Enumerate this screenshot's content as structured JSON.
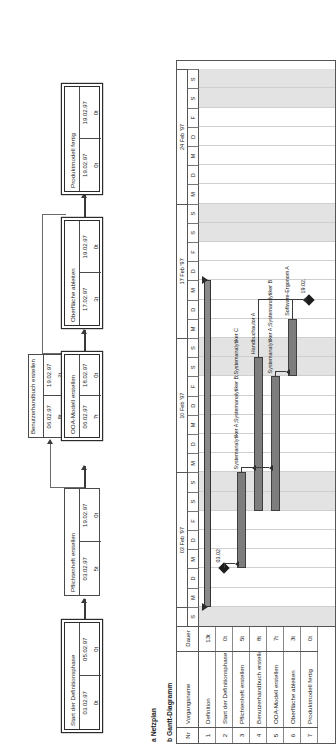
{
  "figure": {
    "caption_a": "a Netzplan",
    "caption_b": "b Gantt-Diagramm",
    "legend": "Legende: Netzplan"
  },
  "netzplan": {
    "nodes": [
      {
        "id": "start",
        "name": "Start der Definitionsphase",
        "early_start": "03.02.97",
        "late_start": "05.02.97",
        "float_left": "0t",
        "float_right": "0t",
        "critical": true
      },
      {
        "id": "pflichtenheft",
        "name": "Pflichtenheft erstellen",
        "early_start": "03.02.97",
        "late_start": "19.02.97",
        "float_left": "5t",
        "float_right": "0t",
        "critical": false
      },
      {
        "id": "benutzerhandbuch",
        "name": "Benutzerhandbuch erstellen",
        "early_start": "06.02.97",
        "late_start": "19.02.97",
        "float_left": "8t",
        "float_right": "2t",
        "critical": false
      },
      {
        "id": "ooa",
        "name": "OOA-Modell erstellen",
        "early_start": "06.02.97",
        "late_start": "18.02.97",
        "float_left": "7t",
        "float_right": "0t",
        "critical": true
      },
      {
        "id": "oberflaeche",
        "name": "Oberfläche ableiten",
        "early_start": "17.02.97",
        "late_start": "19.02.97",
        "float_left": "3t",
        "float_right": "0t",
        "critical": true
      },
      {
        "id": "produktmodell",
        "name": "Produktmodell fertig",
        "early_start": "19.02.97",
        "late_start": "19.02.97",
        "float_left": "0t",
        "float_right": "0t",
        "critical": true
      }
    ]
  },
  "gantt": {
    "columns": {
      "nr": "Nr",
      "name": "Vorgangsname",
      "duration": "Dauer"
    },
    "rows": [
      {
        "nr": "1",
        "name": "Definition",
        "duration": "13t",
        "type": "summary",
        "start_day": 0,
        "length_days": 17,
        "resources": ""
      },
      {
        "nr": "2",
        "name": "Start der Definitionsphase",
        "duration": "0t",
        "type": "milestone",
        "start_day": 2,
        "length_days": 0,
        "resources": "03.02"
      },
      {
        "nr": "3",
        "name": "Pflichtenheft erstellen",
        "duration": "5t",
        "type": "task",
        "start_day": 2,
        "length_days": 5,
        "resources": "Systemanalytiker A;Systemanalytiker B;Systemanalytiker C"
      },
      {
        "nr": "4",
        "name": "Benutzerhandbuch erstellen",
        "duration": "8t",
        "type": "task",
        "start_day": 5,
        "length_days": 8,
        "resources": "Handbuchautor A"
      },
      {
        "nr": "5",
        "name": "OOA-Modell erstellen",
        "duration": "7t",
        "type": "task",
        "start_day": 5,
        "length_days": 7,
        "resources": "Systemanalytiker A;Systemanalytiker B"
      },
      {
        "nr": "6",
        "name": "Oberfläche ableiten",
        "duration": "3t",
        "type": "task",
        "start_day": 12,
        "length_days": 3,
        "resources": "Software-Ergonom A"
      },
      {
        "nr": "7",
        "name": "Produktmodell fertig",
        "duration": "0t",
        "type": "milestone",
        "start_day": 16,
        "length_days": 0,
        "resources": "19.02."
      }
    ],
    "timeline": {
      "weeks": [
        "03 Feb '97",
        "10 Feb '97",
        "17 Feb '97",
        "24 Feb '97"
      ],
      "days": [
        "M",
        "D",
        "M",
        "D",
        "F",
        "S",
        "S"
      ],
      "lead_days": [
        "S"
      ]
    }
  },
  "chart_data": {
    "type": "bar",
    "xlabel": "Kalenderwoche Feb '97",
    "ylabel": "Vorgang",
    "categories": [
      "Definition",
      "Start der Definitionsphase",
      "Pflichtenheft erstellen",
      "Benutzerhandbuch erstellen",
      "OOA-Modell erstellen",
      "Oberfläche ableiten",
      "Produktmodell fertig"
    ],
    "values": [
      13,
      0,
      5,
      8,
      7,
      3,
      0
    ],
    "bar_starts_days": [
      0,
      2,
      2,
      5,
      5,
      12,
      16
    ],
    "series": [
      {
        "name": "Dauer (Tage)",
        "values": [
          13,
          0,
          5,
          8,
          7,
          3,
          0
        ]
      }
    ],
    "axis_weeks": [
      "03 Feb '97",
      "10 Feb '97",
      "17 Feb '97",
      "24 Feb '97"
    ],
    "axis_days": [
      "M",
      "D",
      "M",
      "D",
      "F",
      "S",
      "S"
    ],
    "xlim": [
      0,
      29
    ],
    "grid": true,
    "legend": "none"
  }
}
